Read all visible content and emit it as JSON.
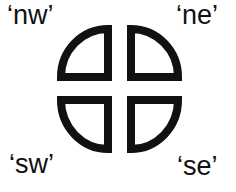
{
  "diagram": {
    "stroke_color": "#111111",
    "background": "#ffffff",
    "labels": {
      "nw": "‘nw’",
      "ne": "‘ne’",
      "sw": "‘sw’",
      "se": "‘se’"
    },
    "quadrants": [
      "nw",
      "ne",
      "sw",
      "se"
    ]
  }
}
